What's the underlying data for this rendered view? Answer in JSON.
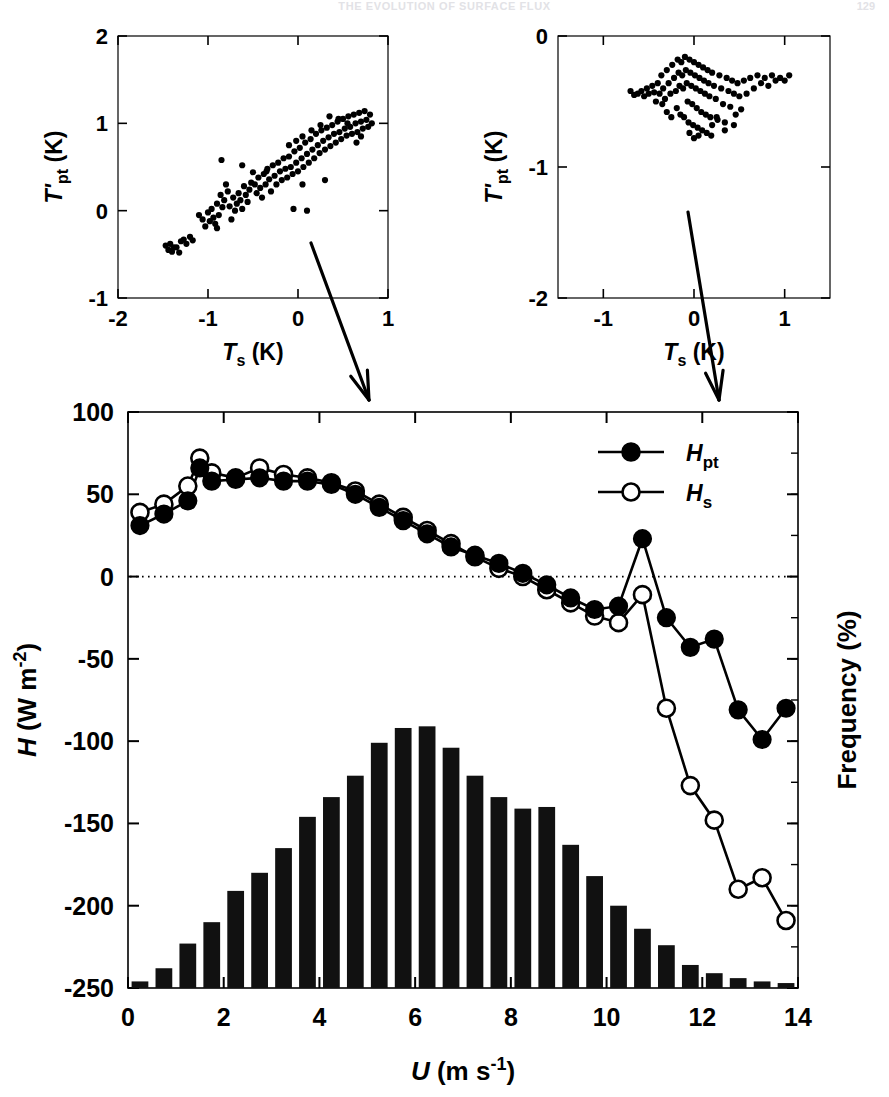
{
  "page": {
    "running_head": "THE EVOLUTION OF SURFACE FLUX",
    "page_number": "129"
  },
  "inset_left": {
    "name": "scatter-low-wind",
    "xlabel": "T_s (K)",
    "xlabel_parts": {
      "sym": "T",
      "sub": "s",
      "unit": " (K)"
    },
    "ylabel_parts": {
      "sym": "T'",
      "sub": "pt",
      "unit": " (K)"
    },
    "xticks": [
      -2,
      -1,
      0,
      1
    ],
    "yticks": [
      -1,
      0,
      1,
      2
    ],
    "xlim": [
      -2,
      1
    ],
    "ylim": [
      -1,
      2
    ]
  },
  "inset_right": {
    "name": "scatter-high-wind",
    "xlabel_parts": {
      "sym": "T",
      "sub": "s",
      "unit": " (K)"
    },
    "ylabel_parts": {
      "sym": "T'",
      "sub": "pt",
      "unit": " (K)"
    },
    "xticks": [
      -1,
      0,
      1
    ],
    "yticks": [
      -2,
      -1,
      0
    ],
    "xlim": [
      -1.5,
      1.5
    ],
    "ylim": [
      -2,
      0
    ]
  },
  "main": {
    "xlabel_parts": {
      "sym": "U",
      "unit": " (m s",
      "sup": "-1",
      "close": ")"
    },
    "ylabel_parts": {
      "sym": "H",
      "unit": " (W m",
      "sup": "-2",
      "close": ")"
    },
    "right_ylabel": "Frequency (%)",
    "xticks": [
      0,
      2,
      4,
      6,
      8,
      10,
      12,
      14
    ],
    "yticks": [
      100,
      50,
      0,
      -50,
      -100,
      -150,
      -200,
      -250
    ],
    "zero_line": 0,
    "legend": [
      {
        "label_sym": "H",
        "label_sub": "pt",
        "marker": "filled-circle"
      },
      {
        "label_sym": "H",
        "label_sub": "s",
        "marker": "open-circle"
      }
    ]
  },
  "chart_data": [
    {
      "type": "scatter",
      "name": "inset-left-scatter",
      "title": "",
      "xlabel": "T_s (K)",
      "ylabel": "T'_pt (K)",
      "xlim": [
        -2,
        1
      ],
      "ylim": [
        -1,
        2
      ],
      "xticks": [
        -2,
        -1,
        0,
        1
      ],
      "yticks": [
        -1,
        0,
        1,
        2
      ],
      "grid": false,
      "points": [
        [
          -1.47,
          -0.4
        ],
        [
          -1.44,
          -0.45
        ],
        [
          -1.42,
          -0.38
        ],
        [
          -1.4,
          -0.47
        ],
        [
          -1.38,
          -0.42
        ],
        [
          -1.3,
          -0.35
        ],
        [
          -1.27,
          -0.33
        ],
        [
          -1.24,
          -0.38
        ],
        [
          -1.2,
          -0.3
        ],
        [
          -1.17,
          -0.34
        ],
        [
          -1.1,
          -0.05
        ],
        [
          -1.06,
          -0.1
        ],
        [
          -1.03,
          -0.18
        ],
        [
          -1.0,
          -0.02
        ],
        [
          -0.98,
          -0.12
        ],
        [
          -0.96,
          0.02
        ],
        [
          -0.94,
          -0.08
        ],
        [
          -0.92,
          -0.15
        ],
        [
          -0.9,
          0.08
        ],
        [
          -0.88,
          -0.05
        ],
        [
          -0.86,
          0.18
        ],
        [
          -0.84,
          0.04
        ],
        [
          -0.82,
          0.12
        ],
        [
          -0.8,
          0.3
        ],
        [
          -0.78,
          0.22
        ],
        [
          -0.76,
          0.05
        ],
        [
          -0.74,
          -0.1
        ],
        [
          -0.72,
          0.15
        ],
        [
          -0.7,
          0.0
        ],
        [
          -0.68,
          0.08
        ],
        [
          -0.66,
          0.2
        ],
        [
          -0.64,
          0.12
        ],
        [
          -0.62,
          0.02
        ],
        [
          -0.6,
          0.28
        ],
        [
          -0.58,
          0.18
        ],
        [
          -0.56,
          0.1
        ],
        [
          -0.54,
          0.24
        ],
        [
          -0.52,
          0.32
        ],
        [
          -0.5,
          0.44
        ],
        [
          -0.48,
          0.3
        ],
        [
          -0.46,
          0.2
        ],
        [
          -0.44,
          0.38
        ],
        [
          -0.42,
          0.26
        ],
        [
          -0.4,
          0.15
        ],
        [
          -0.38,
          0.42
        ],
        [
          -0.36,
          0.3
        ],
        [
          -0.34,
          0.48
        ],
        [
          -0.32,
          0.36
        ],
        [
          -0.3,
          0.22
        ],
        [
          -0.28,
          0.52
        ],
        [
          -0.26,
          0.4
        ],
        [
          -0.24,
          0.3
        ],
        [
          -0.22,
          0.55
        ],
        [
          -0.2,
          0.45
        ],
        [
          -0.18,
          0.35
        ],
        [
          -0.16,
          0.6
        ],
        [
          -0.14,
          0.48
        ],
        [
          -0.12,
          0.38
        ],
        [
          -0.1,
          0.62
        ],
        [
          -0.08,
          0.5
        ],
        [
          -0.06,
          0.42
        ],
        [
          -0.04,
          0.68
        ],
        [
          -0.02,
          0.55
        ],
        [
          0.0,
          0.45
        ],
        [
          0.02,
          0.72
        ],
        [
          0.04,
          0.6
        ],
        [
          0.06,
          0.5
        ],
        [
          0.08,
          0.78
        ],
        [
          0.1,
          0.65
        ],
        [
          0.12,
          0.55
        ],
        [
          0.14,
          0.82
        ],
        [
          0.16,
          0.7
        ],
        [
          0.18,
          0.6
        ],
        [
          0.2,
          0.88
        ],
        [
          0.22,
          0.75
        ],
        [
          0.24,
          0.66
        ],
        [
          0.26,
          0.92
        ],
        [
          0.28,
          0.8
        ],
        [
          0.3,
          0.7
        ],
        [
          0.32,
          0.95
        ],
        [
          0.34,
          0.84
        ],
        [
          0.36,
          0.74
        ],
        [
          0.38,
          0.98
        ],
        [
          0.4,
          0.88
        ],
        [
          0.42,
          0.78
        ],
        [
          0.44,
          1.02
        ],
        [
          0.46,
          0.9
        ],
        [
          0.48,
          0.82
        ],
        [
          0.5,
          1.05
        ],
        [
          0.52,
          0.94
        ],
        [
          0.54,
          0.86
        ],
        [
          0.56,
          1.08
        ],
        [
          0.58,
          0.96
        ],
        [
          0.6,
          0.88
        ],
        [
          0.62,
          1.1
        ],
        [
          0.64,
          1.0
        ],
        [
          0.66,
          0.9
        ],
        [
          0.68,
          1.12
        ],
        [
          0.7,
          1.02
        ],
        [
          0.72,
          0.94
        ],
        [
          0.74,
          1.14
        ],
        [
          0.76,
          1.04
        ],
        [
          0.78,
          0.96
        ],
        [
          0.8,
          1.1
        ],
        [
          0.82,
          1.0
        ],
        [
          -0.85,
          0.58
        ],
        [
          -0.62,
          0.52
        ],
        [
          -0.35,
          0.45
        ],
        [
          0.05,
          0.3
        ],
        [
          0.3,
          0.35
        ],
        [
          -0.05,
          0.02
        ],
        [
          0.1,
          0.0
        ],
        [
          -1.35,
          -0.42
        ],
        [
          -1.32,
          -0.48
        ],
        [
          -0.9,
          -0.2
        ],
        [
          0.65,
          0.78
        ],
        [
          0.7,
          0.85
        ],
        [
          0.55,
          1.0
        ],
        [
          0.45,
          1.05
        ],
        [
          0.35,
          1.08
        ],
        [
          0.25,
          0.98
        ],
        [
          0.15,
          0.92
        ],
        [
          0.05,
          0.85
        ],
        [
          -0.02,
          0.8
        ],
        [
          -0.1,
          0.75
        ]
      ]
    },
    {
      "type": "scatter",
      "name": "inset-right-scatter",
      "title": "",
      "xlabel": "T_s (K)",
      "ylabel": "T'_pt (K)",
      "xlim": [
        -1.5,
        1.5
      ],
      "ylim": [
        -2,
        0
      ],
      "xticks": [
        -1,
        0,
        1
      ],
      "yticks": [
        -2,
        -1,
        0
      ],
      "grid": false,
      "points": [
        [
          -0.62,
          -0.44
        ],
        [
          -0.58,
          -0.42
        ],
        [
          -0.55,
          -0.46
        ],
        [
          -0.52,
          -0.4
        ],
        [
          -0.5,
          -0.44
        ],
        [
          -0.46,
          -0.38
        ],
        [
          -0.44,
          -0.43
        ],
        [
          -0.42,
          -0.5
        ],
        [
          -0.4,
          -0.36
        ],
        [
          -0.38,
          -0.44
        ],
        [
          -0.36,
          -0.3
        ],
        [
          -0.34,
          -0.4
        ],
        [
          -0.32,
          -0.48
        ],
        [
          -0.3,
          -0.26
        ],
        [
          -0.28,
          -0.36
        ],
        [
          -0.26,
          -0.44
        ],
        [
          -0.24,
          -0.22
        ],
        [
          -0.22,
          -0.32
        ],
        [
          -0.2,
          -0.42
        ],
        [
          -0.19,
          -0.55
        ],
        [
          -0.18,
          -0.18
        ],
        [
          -0.17,
          -0.28
        ],
        [
          -0.16,
          -0.38
        ],
        [
          -0.15,
          -0.6
        ],
        [
          -0.14,
          -0.2
        ],
        [
          -0.13,
          -0.3
        ],
        [
          -0.12,
          -0.4
        ],
        [
          -0.11,
          -0.62
        ],
        [
          -0.1,
          -0.16
        ],
        [
          -0.09,
          -0.26
        ],
        [
          -0.08,
          -0.36
        ],
        [
          -0.07,
          -0.5
        ],
        [
          -0.06,
          -0.66
        ],
        [
          -0.05,
          -0.18
        ],
        [
          -0.04,
          -0.28
        ],
        [
          -0.03,
          -0.38
        ],
        [
          -0.02,
          -0.52
        ],
        [
          -0.01,
          -0.68
        ],
        [
          0.0,
          -0.2
        ],
        [
          0.01,
          -0.3
        ],
        [
          0.02,
          -0.4
        ],
        [
          0.03,
          -0.55
        ],
        [
          0.04,
          -0.7
        ],
        [
          0.05,
          -0.22
        ],
        [
          0.06,
          -0.32
        ],
        [
          0.07,
          -0.42
        ],
        [
          0.08,
          -0.58
        ],
        [
          0.09,
          -0.72
        ],
        [
          0.1,
          -0.24
        ],
        [
          0.11,
          -0.34
        ],
        [
          0.12,
          -0.44
        ],
        [
          0.13,
          -0.6
        ],
        [
          0.14,
          -0.74
        ],
        [
          0.15,
          -0.26
        ],
        [
          0.16,
          -0.36
        ],
        [
          0.17,
          -0.46
        ],
        [
          0.18,
          -0.62
        ],
        [
          0.19,
          -0.76
        ],
        [
          0.2,
          -0.28
        ],
        [
          0.22,
          -0.38
        ],
        [
          0.24,
          -0.48
        ],
        [
          0.26,
          -0.64
        ],
        [
          0.28,
          -0.3
        ],
        [
          0.3,
          -0.4
        ],
        [
          0.32,
          -0.52
        ],
        [
          0.34,
          -0.66
        ],
        [
          0.36,
          -0.32
        ],
        [
          0.38,
          -0.42
        ],
        [
          0.4,
          -0.54
        ],
        [
          0.42,
          -0.34
        ],
        [
          0.44,
          -0.44
        ],
        [
          0.46,
          -0.6
        ],
        [
          0.48,
          -0.36
        ],
        [
          0.5,
          -0.46
        ],
        [
          0.52,
          -0.56
        ],
        [
          0.55,
          -0.34
        ],
        [
          0.58,
          -0.44
        ],
        [
          0.62,
          -0.32
        ],
        [
          0.66,
          -0.4
        ],
        [
          0.7,
          -0.3
        ],
        [
          0.74,
          -0.36
        ],
        [
          0.78,
          -0.32
        ],
        [
          0.82,
          -0.38
        ],
        [
          0.86,
          -0.3
        ],
        [
          0.9,
          -0.34
        ],
        [
          0.95,
          -0.32
        ],
        [
          1.0,
          -0.34
        ],
        [
          1.05,
          -0.3
        ],
        [
          -0.66,
          -0.45
        ],
        [
          -0.7,
          -0.42
        ],
        [
          0.2,
          -0.68
        ],
        [
          0.25,
          -0.62
        ],
        [
          -0.25,
          -0.62
        ],
        [
          -0.3,
          -0.58
        ],
        [
          0.0,
          -0.78
        ],
        [
          0.05,
          -0.76
        ],
        [
          -0.05,
          -0.74
        ],
        [
          -0.35,
          -0.52
        ],
        [
          0.44,
          -0.68
        ],
        [
          0.34,
          -0.72
        ]
      ]
    },
    {
      "type": "line",
      "name": "main-flux-curves",
      "title": "",
      "xlabel": "U (m s-1)",
      "ylabel": "H (W m-2)",
      "xlim": [
        0,
        14
      ],
      "ylim": [
        -250,
        100
      ],
      "xticks": [
        0,
        2,
        4,
        6,
        8,
        10,
        12,
        14
      ],
      "yticks": [
        100,
        50,
        0,
        -50,
        -100,
        -150,
        -200,
        -250
      ],
      "grid": false,
      "zero_reference_line": 0,
      "legend_position": "top-right",
      "x": [
        0.25,
        0.75,
        1.25,
        1.5,
        1.75,
        2.25,
        2.75,
        3.25,
        3.75,
        4.25,
        4.75,
        5.25,
        5.75,
        6.25,
        6.75,
        7.25,
        7.75,
        8.25,
        8.75,
        9.25,
        9.75,
        10.25,
        10.75,
        11.25,
        11.75,
        12.25,
        12.75,
        13.25,
        13.75
      ],
      "series": [
        {
          "name": "H_pt",
          "marker": "filled-circle",
          "values": [
            31,
            38,
            46,
            66,
            58,
            59,
            60,
            58,
            58,
            56,
            50,
            42,
            34,
            26,
            18,
            13,
            8,
            2,
            -5,
            -13,
            -20,
            -18,
            23,
            -25,
            -43,
            -38,
            -81,
            -99,
            -80
          ]
        },
        {
          "name": "H_s",
          "marker": "open-circle",
          "values": [
            39,
            44,
            55,
            72,
            63,
            60,
            66,
            62,
            60,
            57,
            52,
            44,
            36,
            28,
            20,
            12,
            5,
            0,
            -8,
            -16,
            -24,
            -28,
            -11,
            -80,
            -127,
            -148,
            -190,
            -183,
            -209
          ]
        }
      ]
    },
    {
      "type": "bar",
      "name": "wind-speed-frequency-histogram",
      "title": "",
      "xlabel": "U (m s-1)",
      "ylabel": "Frequency (%)",
      "xlim": [
        0,
        14
      ],
      "baseline": -250,
      "grid": false,
      "bar_centers": [
        0.25,
        0.75,
        1.25,
        1.75,
        2.25,
        2.75,
        3.25,
        3.75,
        4.25,
        4.75,
        5.25,
        5.75,
        6.25,
        6.75,
        7.25,
        7.75,
        8.25,
        8.75,
        9.25,
        9.75,
        10.25,
        10.75,
        11.25,
        11.75,
        12.25,
        12.75,
        13.25,
        13.75
      ],
      "bar_tops_in_H_units": [
        -246,
        -238,
        -223,
        -210,
        -191,
        -180,
        -165,
        -146,
        -134,
        -121,
        -101,
        -92,
        -91,
        -104,
        -121,
        -134,
        -141,
        -140,
        -163,
        -182,
        -200,
        -214,
        -224,
        -236,
        -241,
        -244,
        -246,
        -247
      ],
      "values_percent": [
        0.16,
        0.48,
        1.08,
        1.6,
        2.36,
        2.8,
        3.4,
        4.16,
        4.64,
        5.16,
        5.96,
        6.32,
        6.36,
        5.84,
        5.16,
        4.64,
        4.36,
        4.4,
        3.48,
        2.72,
        2.0,
        1.44,
        1.04,
        0.56,
        0.36,
        0.24,
        0.16,
        0.12
      ]
    }
  ],
  "annotations": [
    {
      "name": "arrow-from-left-inset",
      "from_inset": "inset_left",
      "points_to": "main-plot"
    },
    {
      "name": "arrow-from-right-inset",
      "from_inset": "inset_right",
      "points_to": "main-plot"
    }
  ]
}
